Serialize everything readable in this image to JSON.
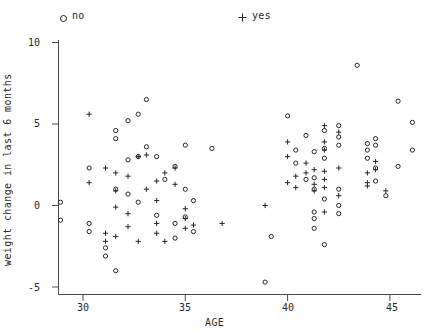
{
  "chart_data": {
    "type": "scatter",
    "title": "",
    "xlabel": "AGE",
    "ylabel": "weight change in last 6 months",
    "xlim": [
      28.4,
      46.5
    ],
    "ylim": [
      -5.6,
      10.9
    ],
    "xticks": [
      30,
      35,
      40,
      45
    ],
    "yticks": [
      10,
      5,
      0,
      -5
    ],
    "grid": false,
    "legend": {
      "position": "top",
      "entries": [
        {
          "name": "no",
          "marker": "circle"
        },
        {
          "name": "yes",
          "marker": "plus"
        }
      ]
    },
    "series": [
      {
        "name": "no",
        "marker": "circle",
        "points": [
          [
            28.9,
            0.2
          ],
          [
            28.9,
            -0.9
          ],
          [
            30.3,
            2.3
          ],
          [
            30.3,
            -1.1
          ],
          [
            30.3,
            -1.6
          ],
          [
            31.1,
            -2.6
          ],
          [
            31.1,
            -3.1
          ],
          [
            31.6,
            4.6
          ],
          [
            31.6,
            4.1
          ],
          [
            31.6,
            1.0
          ],
          [
            31.6,
            -4.0
          ],
          [
            32.2,
            5.2
          ],
          [
            32.2,
            2.8
          ],
          [
            32.2,
            0.7
          ],
          [
            32.7,
            5.6
          ],
          [
            32.7,
            3.0
          ],
          [
            32.7,
            0.2
          ],
          [
            33.1,
            6.5
          ],
          [
            33.1,
            3.6
          ],
          [
            33.6,
            3.0
          ],
          [
            33.6,
            -0.6
          ],
          [
            34.0,
            1.6
          ],
          [
            34.5,
            2.4
          ],
          [
            34.5,
            -1.1
          ],
          [
            34.5,
            -2.0
          ],
          [
            35.0,
            3.7
          ],
          [
            35.0,
            1.0
          ],
          [
            35.0,
            -0.7
          ],
          [
            35.4,
            0.3
          ],
          [
            35.4,
            -1.6
          ],
          [
            36.3,
            3.5
          ],
          [
            38.9,
            -4.7
          ],
          [
            39.2,
            -1.9
          ],
          [
            40.0,
            5.5
          ],
          [
            40.4,
            3.4
          ],
          [
            40.4,
            2.6
          ],
          [
            40.9,
            4.3
          ],
          [
            40.9,
            1.6
          ],
          [
            41.3,
            3.3
          ],
          [
            41.3,
            1.7
          ],
          [
            41.3,
            1.0
          ],
          [
            41.3,
            -0.4
          ],
          [
            41.3,
            -0.8
          ],
          [
            41.3,
            -1.4
          ],
          [
            41.8,
            4.6
          ],
          [
            41.8,
            3.5
          ],
          [
            41.8,
            2.9
          ],
          [
            41.8,
            0.4
          ],
          [
            41.8,
            -2.4
          ],
          [
            42.5,
            4.9
          ],
          [
            42.5,
            4.2
          ],
          [
            42.5,
            3.7
          ],
          [
            42.5,
            1.0
          ],
          [
            42.5,
            0.0
          ],
          [
            42.5,
            -0.5
          ],
          [
            43.4,
            8.6
          ],
          [
            43.9,
            3.8
          ],
          [
            43.9,
            3.4
          ],
          [
            43.9,
            2.9
          ],
          [
            44.3,
            4.1
          ],
          [
            44.3,
            3.7
          ],
          [
            44.3,
            2.3
          ],
          [
            44.3,
            1.5
          ],
          [
            44.8,
            0.6
          ],
          [
            45.4,
            6.4
          ],
          [
            45.4,
            2.4
          ],
          [
            46.1,
            5.1
          ],
          [
            46.1,
            3.4
          ]
        ]
      },
      {
        "name": "yes",
        "marker": "plus",
        "points": [
          [
            30.3,
            5.6
          ],
          [
            30.3,
            1.4
          ],
          [
            31.1,
            2.3
          ],
          [
            31.1,
            -1.7
          ],
          [
            31.1,
            -2.2
          ],
          [
            31.6,
            2.0
          ],
          [
            31.6,
            0.9
          ],
          [
            31.6,
            -0.1
          ],
          [
            31.6,
            -1.9
          ],
          [
            32.2,
            1.8
          ],
          [
            32.2,
            -0.5
          ],
          [
            32.2,
            -1.3
          ],
          [
            32.7,
            3.0
          ],
          [
            32.7,
            -2.2
          ],
          [
            33.1,
            3.1
          ],
          [
            33.1,
            1.0
          ],
          [
            33.6,
            1.5
          ],
          [
            33.6,
            0.3
          ],
          [
            33.6,
            -1.1
          ],
          [
            33.6,
            -1.7
          ],
          [
            34.0,
            2.0
          ],
          [
            34.0,
            -2.2
          ],
          [
            34.5,
            2.3
          ],
          [
            34.5,
            1.3
          ],
          [
            35.0,
            -0.2
          ],
          [
            35.0,
            -0.8
          ],
          [
            35.0,
            -1.4
          ],
          [
            35.4,
            -1.2
          ],
          [
            36.8,
            -1.1
          ],
          [
            38.9,
            0.0
          ],
          [
            40.0,
            3.9
          ],
          [
            40.0,
            3.0
          ],
          [
            40.0,
            1.4
          ],
          [
            40.4,
            1.8
          ],
          [
            40.4,
            1.1
          ],
          [
            40.9,
            2.6
          ],
          [
            40.9,
            2.0
          ],
          [
            41.3,
            2.2
          ],
          [
            41.3,
            1.3
          ],
          [
            41.3,
            0.9
          ],
          [
            41.8,
            4.9
          ],
          [
            41.8,
            3.9
          ],
          [
            41.8,
            3.4
          ],
          [
            41.8,
            2.1
          ],
          [
            41.8,
            1.6
          ],
          [
            41.8,
            1.1
          ],
          [
            41.8,
            -0.4
          ],
          [
            42.5,
            4.5
          ],
          [
            42.5,
            2.3
          ],
          [
            42.5,
            0.6
          ],
          [
            43.9,
            2.0
          ],
          [
            43.9,
            1.4
          ],
          [
            43.9,
            1.2
          ],
          [
            44.3,
            2.7
          ],
          [
            44.3,
            2.2
          ],
          [
            44.8,
            0.9
          ]
        ]
      }
    ]
  },
  "axis": {
    "xtick_labels": [
      "30",
      "35",
      "40",
      "45"
    ],
    "ytick_labels": [
      "10",
      "5",
      "0",
      "-5"
    ]
  },
  "style": {
    "marker_color": "#262626",
    "axis_color": "#4a4a4a",
    "background": "#ffffff"
  }
}
